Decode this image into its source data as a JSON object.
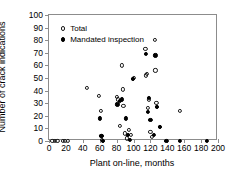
{
  "chart_data": {
    "type": "scatter",
    "title": "",
    "xlabel": "Plant on-line, months",
    "ylabel": "Number of crack indications",
    "xlim": [
      0,
      200
    ],
    "ylim": [
      0,
      100
    ],
    "xticks": [
      0,
      20,
      40,
      60,
      80,
      100,
      120,
      140,
      160,
      180,
      200
    ],
    "yticks": [
      0,
      10,
      20,
      30,
      40,
      50,
      60,
      70,
      80,
      90,
      100
    ],
    "grid": false,
    "legend_position": "upper left",
    "series": [
      {
        "name": "Total",
        "marker": "open-circle",
        "color": "#1a1a1a",
        "points": [
          [
            4,
            0
          ],
          [
            7,
            0
          ],
          [
            10,
            0
          ],
          [
            16,
            0
          ],
          [
            19,
            0
          ],
          [
            22,
            0
          ],
          [
            45,
            42
          ],
          [
            59,
            36
          ],
          [
            61,
            24
          ],
          [
            62,
            4
          ],
          [
            63,
            1
          ],
          [
            64,
            0
          ],
          [
            80,
            35
          ],
          [
            82,
            33
          ],
          [
            84,
            12
          ],
          [
            86,
            60
          ],
          [
            87,
            41
          ],
          [
            88,
            28
          ],
          [
            90,
            6
          ],
          [
            92,
            2
          ],
          [
            95,
            9
          ],
          [
            97,
            5
          ],
          [
            99,
            49
          ],
          [
            100,
            50
          ],
          [
            114,
            73
          ],
          [
            115,
            52
          ],
          [
            116,
            53
          ],
          [
            117,
            26
          ],
          [
            118,
            33
          ],
          [
            120,
            7
          ],
          [
            122,
            3
          ],
          [
            125,
            80
          ],
          [
            126,
            56
          ],
          [
            127,
            30
          ],
          [
            128,
            27
          ],
          [
            131,
            11
          ],
          [
            155,
            24
          ]
        ]
      },
      {
        "name": "Mandated inspection",
        "marker": "filled-circle",
        "color": "#000000",
        "points": [
          [
            60,
            18
          ],
          [
            62,
            4
          ],
          [
            64,
            0
          ],
          [
            81,
            29
          ],
          [
            84,
            32
          ],
          [
            86,
            33
          ],
          [
            91,
            18
          ],
          [
            93,
            5
          ],
          [
            96,
            1
          ],
          [
            99,
            49
          ],
          [
            115,
            69
          ],
          [
            117,
            23
          ],
          [
            118,
            34
          ],
          [
            120,
            17
          ],
          [
            124,
            5
          ],
          [
            126,
            68
          ],
          [
            128,
            27
          ],
          [
            131,
            11
          ],
          [
            139,
            0
          ],
          [
            155,
            0
          ],
          [
            187,
            0
          ]
        ]
      }
    ]
  },
  "legend": {
    "entries": [
      {
        "label": "Total",
        "marker": "open-circle"
      },
      {
        "label": "Mandated inspection",
        "marker": "filled-circle"
      }
    ]
  }
}
